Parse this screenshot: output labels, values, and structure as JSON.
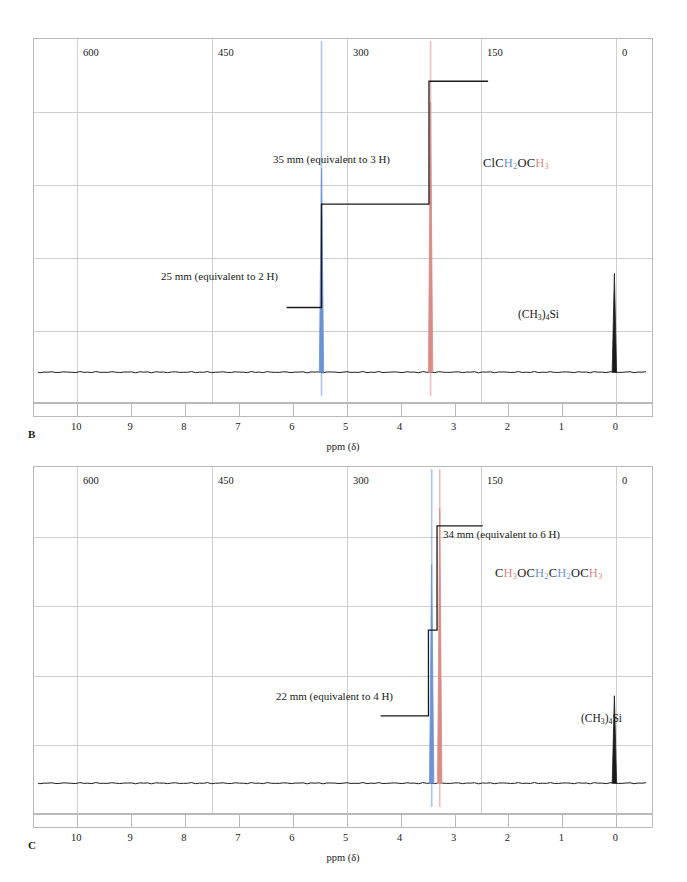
{
  "figure": {
    "axis_title": "ppm (δ)",
    "hz_unit_label": "900 Hz",
    "hz_ticks": [
      "900 Hz",
      "750",
      "600",
      "450",
      "300",
      "150",
      "0"
    ],
    "hz_values": [
      900,
      750,
      600,
      450,
      300,
      150,
      0
    ],
    "ppm_ticks": [
      "10",
      "9",
      "8",
      "7",
      "6",
      "5",
      "4",
      "3",
      "2",
      "1",
      "0"
    ],
    "ppm_values": [
      10,
      9,
      8,
      7,
      6,
      5,
      4,
      3,
      2,
      1,
      0
    ],
    "tms_label_parts": {
      "open": "(CH",
      "sub1": "3",
      "close": ")",
      "sub2": "4",
      "si": "Si"
    },
    "colors": {
      "peak_blue": "#6c92d6",
      "peak_red": "#d98b86",
      "trace": "#1a1a1a",
      "grid": "#cfcfcf",
      "frame": "#b9b9b9"
    }
  },
  "panel_b": {
    "letter": "B",
    "integral_high_label": "35 mm (equivalent to 3 H)",
    "integral_low_label": "25 mm (equivalent to 2 H)",
    "tms_label": "(CH3)4Si",
    "structure_plain": "ClCH2OCH3",
    "structure_parts": [
      {
        "text": "ClC",
        "color": "black"
      },
      {
        "text": "H",
        "color": "blue"
      },
      {
        "text": "2",
        "color": "blue",
        "sub": true
      },
      {
        "text": "OC",
        "color": "black"
      },
      {
        "text": "H",
        "color": "red"
      },
      {
        "text": "3",
        "color": "red",
        "sub": true
      }
    ]
  },
  "panel_c": {
    "letter": "C",
    "integral_high_label": "34 mm (equivalent to 6 H)",
    "integral_low_label": "22 mm (equivalent to 4 H)",
    "tms_label": "(CH3)4Si",
    "structure_plain": "CH3OCH2CH2OCH3",
    "structure_parts": [
      {
        "text": "C",
        "color": "black"
      },
      {
        "text": "H",
        "color": "red"
      },
      {
        "text": "3",
        "color": "red",
        "sub": true
      },
      {
        "text": "OC",
        "color": "black"
      },
      {
        "text": "H",
        "color": "blue"
      },
      {
        "text": "2",
        "color": "blue",
        "sub": true
      },
      {
        "text": "C",
        "color": "black"
      },
      {
        "text": "H",
        "color": "blue"
      },
      {
        "text": "2",
        "color": "blue",
        "sub": true
      },
      {
        "text": "OC",
        "color": "black"
      },
      {
        "text": "H",
        "color": "red"
      },
      {
        "text": "3",
        "color": "red",
        "sub": true
      }
    ]
  },
  "chart_data": [
    {
      "type": "line",
      "id": "panel-b-spectrum",
      "title": "B",
      "xlabel": "ppm (δ)",
      "ylabel": "",
      "xlim": [
        10.8,
        -0.7
      ],
      "secondary_xlabel": "Hz",
      "secondary_xlim": [
        972,
        -63
      ],
      "grid": true,
      "compound": "ClCH2OCH3",
      "peaks": [
        {
          "name": "CH2",
          "shift_ppm": 5.45,
          "shift_hz": 327,
          "color": "#6c92d6",
          "rel_height": 0.62,
          "integral_mm": 25,
          "protons": 2
        },
        {
          "name": "CH3",
          "shift_ppm": 3.42,
          "shift_hz": 205,
          "color": "#d98b86",
          "rel_height": 0.82,
          "integral_mm": 35,
          "protons": 3
        },
        {
          "name": "TMS",
          "shift_ppm": 0.0,
          "shift_hz": 0,
          "color": "#1a1a1a",
          "rel_height": 0.3,
          "integral_mm": 0,
          "protons": 12
        }
      ],
      "integral_steps": [
        {
          "from_ppm": 6.1,
          "to_ppm": 5.45,
          "level": 0.2,
          "label": "25 mm (equivalent to 2 H)"
        },
        {
          "from_ppm": 5.45,
          "to_ppm": 3.45,
          "level": 0.52,
          "label": ""
        },
        {
          "from_ppm": 3.45,
          "to_ppm": 2.35,
          "level": 0.9,
          "label": "35 mm (equivalent to 3 H)"
        }
      ]
    },
    {
      "type": "line",
      "id": "panel-c-spectrum",
      "title": "C",
      "xlabel": "ppm (δ)",
      "ylabel": "",
      "xlim": [
        10.8,
        -0.7
      ],
      "secondary_xlabel": "Hz",
      "secondary_xlim": [
        972,
        -63
      ],
      "grid": true,
      "compound": "CH3OCH2CH2OCH3",
      "peaks": [
        {
          "name": "CH2",
          "shift_ppm": 3.4,
          "shift_hz": 204,
          "color": "#6c92d6",
          "rel_height": 0.7,
          "integral_mm": 22,
          "protons": 4
        },
        {
          "name": "CH3",
          "shift_ppm": 3.25,
          "shift_hz": 195,
          "color": "#d98b86",
          "rel_height": 0.88,
          "integral_mm": 34,
          "protons": 6
        },
        {
          "name": "TMS",
          "shift_ppm": 0.0,
          "shift_hz": 0,
          "color": "#1a1a1a",
          "rel_height": 0.28,
          "integral_mm": 0,
          "protons": 12
        }
      ],
      "integral_steps": [
        {
          "from_ppm": 4.35,
          "to_ppm": 3.46,
          "level": 0.22,
          "label": "22 mm (equivalent to 4 H)"
        },
        {
          "from_ppm": 3.46,
          "to_ppm": 3.3,
          "level": 0.5,
          "label": ""
        },
        {
          "from_ppm": 3.3,
          "to_ppm": 2.45,
          "level": 0.84,
          "label": "34 mm (equivalent to 6 H)"
        }
      ]
    }
  ]
}
